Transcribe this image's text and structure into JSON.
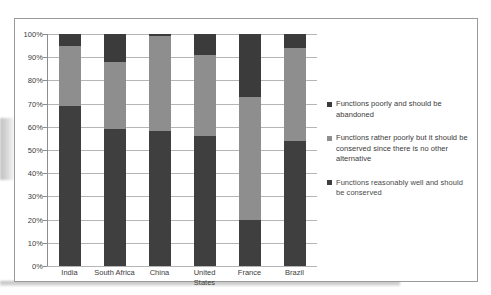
{
  "chart_data": {
    "type": "bar",
    "subtype": "stacked-100-percent",
    "title": "",
    "xlabel": "",
    "ylabel": "",
    "ylim": [
      0,
      100
    ],
    "ytick_labels": [
      "100%",
      "90%",
      "80%",
      "70%",
      "60%",
      "50%",
      "40%",
      "30%",
      "20%",
      "10%",
      "0%"
    ],
    "ytick_values": [
      100,
      90,
      80,
      70,
      60,
      50,
      40,
      30,
      20,
      10,
      0
    ],
    "grid": true,
    "legend_position": "right",
    "categories": [
      "India",
      "South Africa",
      "China",
      "United States",
      "France",
      "Brazil"
    ],
    "series": [
      {
        "name": "Functions reasonably well and should be conserved",
        "color": "#3f3f3f",
        "values": [
          69,
          59,
          58,
          56,
          20,
          54
        ]
      },
      {
        "name": "Functions rather poorly but it should be conserved since there is no other alternative",
        "color": "#8e8e8e",
        "values": [
          26,
          29,
          41,
          35,
          53,
          40
        ]
      },
      {
        "name": "Functions poorly and should be abandoned",
        "color": "#3b3b3b",
        "values": [
          5,
          12,
          1,
          9,
          27,
          6
        ]
      }
    ]
  },
  "legend": {
    "entries": [
      {
        "label": "Functions poorly and should be abandoned",
        "color": "#3b3b3b",
        "marker": "square-marker"
      },
      {
        "label": "Functions rather poorly but it should be conserved since there is no other alternative",
        "color": "#8e8e8e",
        "marker": "square-marker"
      },
      {
        "label": "Functions reasonably well and should be conserved",
        "color": "#3f3f3f",
        "marker": "square-marker"
      }
    ]
  },
  "axis": {
    "x_labels": [
      {
        "line1": "India",
        "line2": ""
      },
      {
        "line1": "South Africa",
        "line2": ""
      },
      {
        "line1": "China",
        "line2": ""
      },
      {
        "line1": "United",
        "line2": "States"
      },
      {
        "line1": "France",
        "line2": ""
      },
      {
        "line1": "Brazil",
        "line2": ""
      }
    ]
  }
}
